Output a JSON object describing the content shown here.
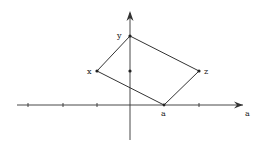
{
  "diagram": {
    "colors": {
      "stroke": "#333333",
      "background": "#ffffff"
    },
    "axes": {
      "horizontal": {
        "y": 105,
        "x_start": 17,
        "x_end": 243,
        "label": "a",
        "label_pos": [
          245,
          114
        ]
      },
      "vertical": {
        "x": 130,
        "y_start": 140,
        "y_end": 12
      },
      "ticks_x": [
        28,
        63,
        97,
        164,
        199
      ]
    },
    "points": [
      {
        "id": "y",
        "label": "y",
        "x": 130,
        "y": 36,
        "label_x": 118,
        "label_y": 36
      },
      {
        "id": "x",
        "label": "x",
        "x": 97,
        "y": 71,
        "label_x": 88,
        "label_y": 74
      },
      {
        "id": "z",
        "label": "z",
        "x": 199,
        "y": 71,
        "label_x": 204,
        "label_y": 74
      },
      {
        "id": "a",
        "label": "a",
        "x": 164,
        "y": 105,
        "label_x": 161,
        "label_y": 115
      }
    ],
    "center_dot": {
      "x": 130,
      "y": 71
    },
    "quadrilateral": [
      "y",
      "z",
      "a",
      "x"
    ]
  }
}
